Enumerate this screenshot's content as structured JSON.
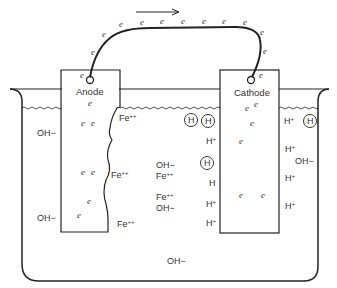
{
  "diagram": {
    "type": "electrochemical corrosion cell",
    "electron_symbol": "e",
    "flow_arrow": "→",
    "anode": {
      "label": "Anode",
      "electrons": [
        "e",
        "e",
        "e",
        "e",
        "e",
        "e",
        "e",
        "e"
      ],
      "adjacent_ions": [
        "Fe++",
        "Fe++",
        "Fe++"
      ]
    },
    "cathode": {
      "label": "Cathode",
      "electrons": [
        "e",
        "e",
        "e",
        "e",
        "e",
        "e",
        "e"
      ]
    },
    "wire_electrons": [
      "e",
      "e",
      "e",
      "e",
      "e",
      "e",
      "e",
      "e",
      "e",
      "e",
      "e",
      "e"
    ],
    "solution_labels": {
      "left_oh_top": "OH−",
      "left_oh_bottom": "OH−",
      "fe1": "Fe",
      "fe2": "Fe",
      "fe3": "Fe",
      "fe_mid1": "Fe",
      "fe_mid2": "Fe",
      "oh_mid1": "OH−",
      "oh_mid2": "OH−",
      "oh_bottom": "OH−",
      "oh_right": "OH−",
      "h_atom": "H",
      "h_circled": "H",
      "h_plain": "H",
      "h_ion": "H",
      "plus": "+",
      "plusplus": "++"
    }
  }
}
